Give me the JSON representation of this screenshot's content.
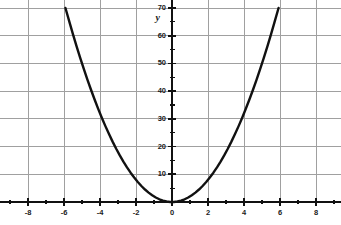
{
  "chart_data": {
    "type": "line",
    "title": "",
    "xlabel": "",
    "ylabel": "y",
    "xlim": [
      -9.55,
      9.4
    ],
    "ylim": [
      -7.8,
      70
    ],
    "xticks": [
      -8,
      -6,
      -4,
      -2,
      0,
      2,
      4,
      6,
      8
    ],
    "xtick_labels": [
      "-8",
      "-6",
      "-4",
      "-2",
      "0",
      "2",
      "4",
      "6",
      "8"
    ],
    "yticks": [
      10,
      20,
      30,
      40,
      50,
      60,
      70
    ],
    "ytick_labels": [
      "10",
      "20",
      "30",
      "40",
      "50",
      "60",
      "70"
    ],
    "x_minor_tick_step": 1,
    "y_minor_tick_step": 5,
    "grid": true,
    "grid_color": "#a0a0a0",
    "axis_color": "#111111",
    "curve_color": "#111111",
    "background": "#ffffff",
    "legend": "none",
    "series": [
      {
        "name": "y = 2x^2",
        "equation": "y = 2*x^2",
        "color": "#111111",
        "x": [
          -5.92,
          -5.7,
          -5.5,
          -5.3,
          -5.1,
          -4.9,
          -4.7,
          -4.5,
          -4.3,
          -4.1,
          -3.9,
          -3.7,
          -3.5,
          -3.3,
          -3.1,
          -2.9,
          -2.7,
          -2.5,
          -2.3,
          -2.1,
          -1.9,
          -1.7,
          -1.5,
          -1.3,
          -1.1,
          -0.9,
          -0.7,
          -0.5,
          -0.3,
          -0.1,
          0,
          0.1,
          0.3,
          0.5,
          0.7,
          0.9,
          1.1,
          1.3,
          1.5,
          1.7,
          1.9,
          2.1,
          2.3,
          2.5,
          2.7,
          2.9,
          3.1,
          3.3,
          3.5,
          3.7,
          3.9,
          4.1,
          4.3,
          4.5,
          4.7,
          4.9,
          5.1,
          5.3,
          5.5,
          5.7,
          5.92
        ],
        "y": [
          70.0,
          64.98,
          60.5,
          56.18,
          52.02,
          48.02,
          44.18,
          40.5,
          36.98,
          33.62,
          30.42,
          27.38,
          24.5,
          21.78,
          19.22,
          16.82,
          14.58,
          12.5,
          10.58,
          8.82,
          7.22,
          5.78,
          4.5,
          3.38,
          2.42,
          1.62,
          0.98,
          0.5,
          0.18,
          0.02,
          0,
          0.02,
          0.18,
          0.5,
          0.98,
          1.62,
          2.42,
          3.38,
          4.5,
          5.78,
          7.22,
          8.82,
          10.58,
          12.5,
          14.58,
          16.82,
          19.22,
          21.78,
          24.5,
          27.38,
          30.42,
          33.62,
          36.98,
          40.5,
          44.18,
          48.02,
          52.02,
          56.18,
          60.5,
          64.98,
          70.0
        ]
      }
    ],
    "annotations": [
      {
        "text": "y",
        "x": -0.75,
        "y": 66.5,
        "role": "y-axis-name"
      }
    ]
  }
}
